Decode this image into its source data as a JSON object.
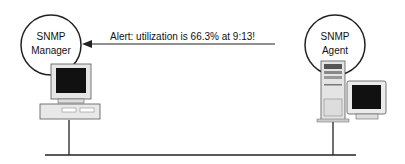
{
  "manager": {
    "line1": "SNMP",
    "line2": "Manager"
  },
  "agent": {
    "line1": "SNMP",
    "line2": "Agent"
  },
  "message": "Alert: utilization is 66.3% at 9:13!"
}
